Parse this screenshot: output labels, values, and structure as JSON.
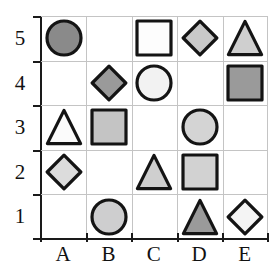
{
  "diagram": {
    "x_axis": {
      "name": "column-axis",
      "ticks": [
        "A",
        "B",
        "C",
        "D",
        "E"
      ]
    },
    "y_axis": {
      "name": "row-axis",
      "ticks": [
        "5",
        "4",
        "3",
        "2",
        "1"
      ]
    },
    "colors": {
      "outline": "#141414",
      "gridline": "#c4c4c4",
      "axis": "#1a1a1a",
      "fill_white": "#fdfdfd",
      "fill_light": "#d6d6d6",
      "fill_medium": "#9a9a9a",
      "fill_dark": "#8a8a8a"
    },
    "cells": [
      {
        "id": "A5",
        "col": "A",
        "row": "5",
        "shape": "circle",
        "fill": "#8a8a8a"
      },
      {
        "id": "B5",
        "col": "B",
        "row": "5",
        "shape": "empty",
        "fill": "none"
      },
      {
        "id": "C5",
        "col": "C",
        "row": "5",
        "shape": "square",
        "fill": "#fdfdfd"
      },
      {
        "id": "D5",
        "col": "D",
        "row": "5",
        "shape": "diamond",
        "fill": "#c9c9c9"
      },
      {
        "id": "E5",
        "col": "E",
        "row": "5",
        "shape": "triangle",
        "fill": "#cfcfcf"
      },
      {
        "id": "A4",
        "col": "A",
        "row": "4",
        "shape": "empty",
        "fill": "none"
      },
      {
        "id": "B4",
        "col": "B",
        "row": "4",
        "shape": "diamond",
        "fill": "#9a9a9a"
      },
      {
        "id": "C4",
        "col": "C",
        "row": "4",
        "shape": "circle",
        "fill": "#f2f2f2"
      },
      {
        "id": "D4",
        "col": "D",
        "row": "4",
        "shape": "empty",
        "fill": "none"
      },
      {
        "id": "E4",
        "col": "E",
        "row": "4",
        "shape": "square",
        "fill": "#9a9a9a"
      },
      {
        "id": "A3",
        "col": "A",
        "row": "3",
        "shape": "triangle",
        "fill": "#fbfbfb"
      },
      {
        "id": "B3",
        "col": "B",
        "row": "3",
        "shape": "square",
        "fill": "#c4c4c4"
      },
      {
        "id": "C3",
        "col": "C",
        "row": "3",
        "shape": "empty",
        "fill": "none"
      },
      {
        "id": "D3",
        "col": "D",
        "row": "3",
        "shape": "circle",
        "fill": "#d4d4d4"
      },
      {
        "id": "E3",
        "col": "E",
        "row": "3",
        "shape": "empty",
        "fill": "none"
      },
      {
        "id": "A2",
        "col": "A",
        "row": "2",
        "shape": "diamond",
        "fill": "#dcdcdc"
      },
      {
        "id": "B2",
        "col": "B",
        "row": "2",
        "shape": "empty",
        "fill": "none"
      },
      {
        "id": "C2",
        "col": "C",
        "row": "2",
        "shape": "triangle",
        "fill": "#cfcfcf"
      },
      {
        "id": "D2",
        "col": "D",
        "row": "2",
        "shape": "square",
        "fill": "#d2d2d2"
      },
      {
        "id": "E2",
        "col": "E",
        "row": "2",
        "shape": "empty",
        "fill": "none"
      },
      {
        "id": "A1",
        "col": "A",
        "row": "1",
        "shape": "empty",
        "fill": "none"
      },
      {
        "id": "B1",
        "col": "B",
        "row": "1",
        "shape": "circle",
        "fill": "#cececf"
      },
      {
        "id": "C1",
        "col": "C",
        "row": "1",
        "shape": "empty",
        "fill": "none"
      },
      {
        "id": "D1",
        "col": "D",
        "row": "1",
        "shape": "triangle",
        "fill": "#9a9a9a"
      },
      {
        "id": "E1",
        "col": "E",
        "row": "1",
        "shape": "diamond",
        "fill": "#f4f4f4"
      }
    ]
  }
}
